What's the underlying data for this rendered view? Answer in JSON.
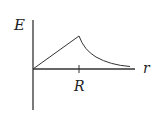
{
  "diagram": {
    "type": "electric-field-vs-radius",
    "y_axis_label": "E",
    "x_axis_label": "r",
    "tick_label": "R",
    "regions": [
      {
        "range": "0 to R",
        "behavior": "linear increase"
      },
      {
        "range": "R to infinity",
        "behavior": "decreasing as 1/r^2"
      }
    ],
    "colors": {
      "line": "#333333",
      "background": "#ffffff"
    }
  }
}
